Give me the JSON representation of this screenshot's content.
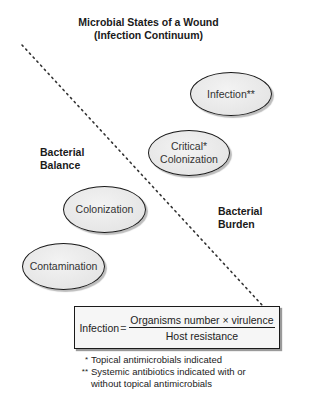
{
  "title": {
    "line1": "Microbial States of a Wound",
    "line2": "(Infection Continuum)"
  },
  "regions": {
    "left_line1": "Bacterial",
    "left_line2": "Balance",
    "right_line1": "Bacterial",
    "right_line2": "Burden"
  },
  "states": [
    {
      "line1": "Infection**",
      "line2": ""
    },
    {
      "line1": "Critical*",
      "line2": "Colonization"
    },
    {
      "line1": "Colonization",
      "line2": ""
    },
    {
      "line1": "Contamination",
      "line2": ""
    }
  ],
  "formula": {
    "lhs": "Infection",
    "equals": "=",
    "numerator": "Organisms number × virulence",
    "denominator": "Host resistance"
  },
  "notes": [
    {
      "mark": "*",
      "text": "Topical antimicrobials indicated"
    },
    {
      "mark": "**",
      "text": "Systemic antibiotics indicated with or without topical antimicrobials"
    }
  ]
}
